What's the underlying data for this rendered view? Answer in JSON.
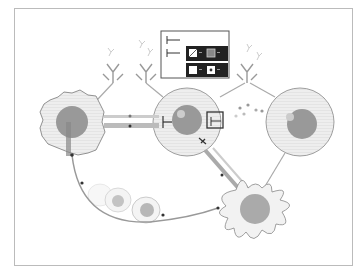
{
  "diagram": {
    "type": "immune-cell-interaction",
    "colors": {
      "cell_fill": "#eeeeee",
      "cell_stroke": "#888888",
      "nucleus": "#999999",
      "nucleus_dark": "#888888",
      "line": "#aaaaaa",
      "dark": "#333333",
      "legend_dark": "#222222"
    },
    "nodes": [
      {
        "id": "tumor-cell",
        "shape": "irregular"
      },
      {
        "id": "center-t-cell",
        "shape": "circle"
      },
      {
        "id": "right-cell",
        "shape": "circle"
      },
      {
        "id": "dendritic-cell",
        "shape": "spiky"
      },
      {
        "id": "dying-cells",
        "shape": "fragments"
      }
    ],
    "legend": {
      "rows": 3,
      "icons": [
        "inhibitor-icon",
        "inhibitor-icon",
        "hatched-square-icon",
        "boxed-square-icon",
        "white-square-icon",
        "dotted-square-icon"
      ]
    }
  }
}
